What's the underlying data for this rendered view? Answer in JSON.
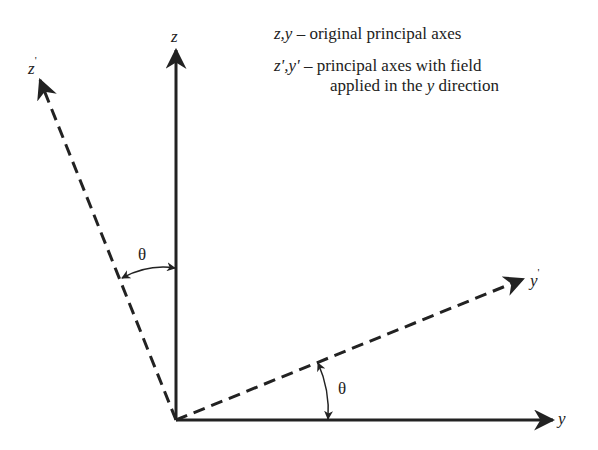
{
  "diagram": {
    "type": "coordinate-axes-rotation",
    "axes": {
      "z": {
        "label": "z",
        "style": "solid"
      },
      "y": {
        "label": "y",
        "style": "solid"
      },
      "z_prime": {
        "label": "z",
        "prime": "'",
        "style": "dashed"
      },
      "y_prime": {
        "label": "y",
        "prime": "'",
        "style": "dashed"
      }
    },
    "angles": [
      {
        "label": "θ",
        "between": "z and z'"
      },
      {
        "label": "θ",
        "between": "y and y'"
      }
    ],
    "legend": {
      "line1_vars": "z,y",
      "line1_text": " – original principal axes",
      "line2_vars": "z',y'",
      "line2_text": " – principal axes with field",
      "line3_pre": "applied in the ",
      "line3_var": "y",
      "line3_post": " direction"
    },
    "colors": {
      "ink": "#222222",
      "background": "#ffffff"
    }
  }
}
